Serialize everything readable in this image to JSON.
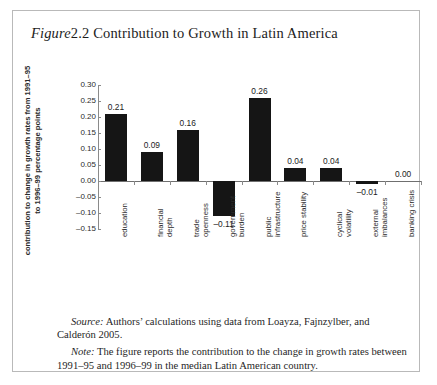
{
  "figure": {
    "label_italic": "Figure",
    "title_rest": "2.2 Contribution to Growth in Latin America"
  },
  "chart_data": {
    "type": "bar",
    "title": "Contribution to Growth in Latin America",
    "xlabel": "",
    "ylabel": "contribution to change in growth rates from 1991–95 to 1996–99 percentage points",
    "ylim": [
      -0.15,
      0.3
    ],
    "ytick_labels": [
      "0.30",
      "0.25",
      "0.20",
      "0.15",
      "0.10",
      "0.05",
      "0.00",
      "–0.05",
      "–0.10",
      "–0.15"
    ],
    "ytick_values": [
      0.3,
      0.25,
      0.2,
      0.15,
      0.1,
      0.05,
      0.0,
      -0.05,
      -0.1,
      -0.15
    ],
    "grid": false,
    "legend": "none",
    "bar_color": "#151515",
    "categories": [
      "education",
      "financial\ndepth",
      "trade\nopenness",
      "government\nburden",
      "public\ninfrastructure",
      "price stability",
      "cyclical\nvolatility",
      "external\nimbalances",
      "banking crisis"
    ],
    "values": [
      0.21,
      0.09,
      0.16,
      -0.11,
      0.26,
      0.04,
      0.04,
      -0.01,
      0.0
    ],
    "value_labels": [
      "0.21",
      "0.09",
      "0.16",
      "–0.11",
      "0.26",
      "0.04",
      "0.04",
      "–0.01",
      "0.00"
    ]
  },
  "footnotes": {
    "source_lead": "Source:",
    "source_text": " Authors’ calculations using data from Loayza, Fajnzylber, and Calderón 2005.",
    "note_lead": "Note:",
    "note_text": " The figure reports the contribution to the change in growth rates between 1991–95 and 1996–99 in the median Latin American country."
  }
}
